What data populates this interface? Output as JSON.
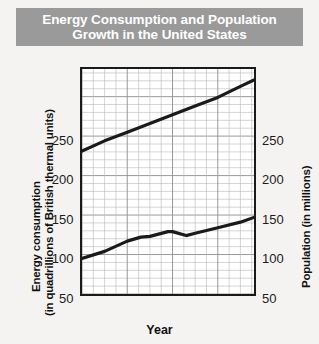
{
  "title": "Energy Consumption and Population\nGrowth in the United States",
  "colors": {
    "title_bar": "#9a9a9a",
    "title_text": "#ffffff",
    "page_background": "#f4f3f1",
    "plot_background": "#ffffff",
    "axis": "#1a1a1a",
    "grid_minor": "#b9b9b9",
    "grid_major": "#8e8e8e",
    "line": "#1a1a1a"
  },
  "axes": {
    "x": {
      "label": "Year",
      "ticks": [
        "1960",
        "1970",
        "1980",
        "1990",
        "1998"
      ],
      "tick_values": [
        1960,
        1970,
        1980,
        1990,
        1998
      ],
      "range": [
        1960,
        1998
      ]
    },
    "y_left": {
      "label_line1": "Energy consumption",
      "label_line2": "(in quadrillions of British thermal units)",
      "ticks": [
        "50",
        "100",
        "150",
        "200",
        "250"
      ],
      "tick_values": [
        50,
        100,
        150,
        200,
        250
      ],
      "range": [
        0,
        285
      ]
    },
    "y_right": {
      "label": "Population (in millions)",
      "ticks": [
        "50",
        "100",
        "150",
        "200",
        "250"
      ],
      "tick_values": [
        50,
        100,
        150,
        200,
        250
      ],
      "range": [
        0,
        285
      ]
    }
  },
  "chart_data": {
    "type": "line",
    "title": "Energy Consumption and Population Growth in the United States",
    "xlabel": "Year",
    "ylabel": "Energy consumption (in quadrillions of British thermal units)",
    "ylabel_right": "Population (in millions)",
    "xlim": [
      1960,
      1998
    ],
    "ylim": [
      0,
      285
    ],
    "grid": true,
    "grid_minor_y_step": 10,
    "grid_major_y_step": 50,
    "grid_minor_x_step": 2.5,
    "grid_major_x_step": 10,
    "legend": "none",
    "series": [
      {
        "name": "Population (in millions)",
        "axis": "right",
        "x": [
          1960,
          1965,
          1970,
          1975,
          1980,
          1985,
          1990,
          1995,
          1998
        ],
        "values": [
          181,
          194,
          205,
          216,
          227,
          238,
          249,
          263,
          271
        ]
      },
      {
        "name": "Energy consumption (in quadrillions of British thermal units)",
        "axis": "left",
        "x": [
          1960,
          1965,
          1970,
          1973,
          1975,
          1979,
          1980,
          1983,
          1985,
          1990,
          1995,
          1998
        ],
        "values": [
          45,
          54,
          67,
          72,
          73,
          79,
          79,
          74,
          77,
          84,
          91,
          97
        ]
      }
    ]
  }
}
